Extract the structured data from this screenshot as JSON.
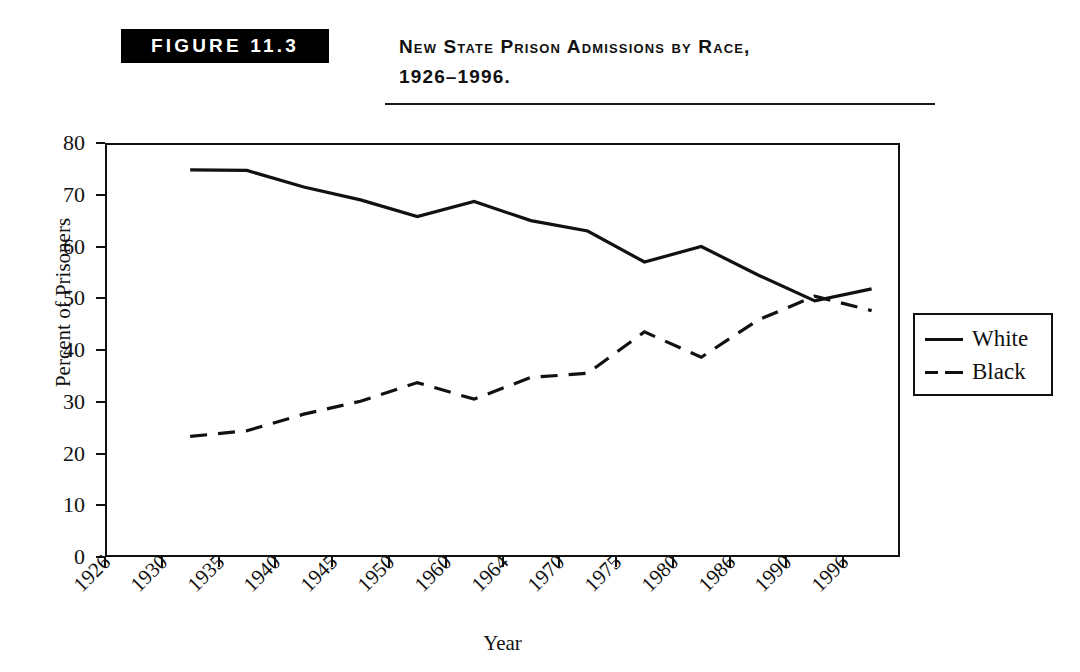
{
  "figure": {
    "badge_label": "FIGURE 11.3",
    "title_line1": "New State Prison Admissions by Race,",
    "title_line2": "1926–1996."
  },
  "legend": {
    "position": "right",
    "entries": [
      {
        "label": "White",
        "style": "solid"
      },
      {
        "label": "Black",
        "style": "dashed"
      }
    ]
  },
  "chart_data": {
    "type": "line",
    "title": "New State Prison Admissions by Race, 1926–1996.",
    "xlabel": "Year",
    "ylabel": "Percent of Prisoners",
    "categories": [
      "1926",
      "1930",
      "1935",
      "1940",
      "1945",
      "1950",
      "1960",
      "1964",
      "1970",
      "1975",
      "1980",
      "1986",
      "1990",
      "1996"
    ],
    "x_tick_labels": [
      "1926",
      "1930",
      "1935",
      "1940",
      "1945",
      "1950",
      "1960",
      "1964",
      "1970",
      "1975",
      "1980",
      "1986",
      "1990",
      "1996"
    ],
    "y_tick_labels": [
      "0",
      "10",
      "20",
      "30",
      "40",
      "50",
      "60",
      "70",
      "80"
    ],
    "y_ticks": [
      0,
      10,
      20,
      30,
      40,
      50,
      60,
      70,
      80
    ],
    "ylim": [
      0,
      80
    ],
    "grid": false,
    "series": [
      {
        "name": "White",
        "style": "solid",
        "color": "#111111",
        "x": [
          "1930",
          "1935",
          "1940",
          "1945",
          "1950",
          "1960",
          "1964",
          "1970",
          "1975",
          "1980",
          "1986",
          "1990",
          "1996"
        ],
        "values": [
          74.8,
          74.7,
          71.5,
          69.0,
          65.8,
          68.7,
          65.0,
          63.0,
          57.0,
          60.0,
          54.5,
          49.5,
          51.8
        ]
      },
      {
        "name": "Black",
        "style": "dashed",
        "color": "#111111",
        "x": [
          "1930",
          "1935",
          "1940",
          "1945",
          "1950",
          "1960",
          "1964",
          "1970",
          "1975",
          "1980",
          "1986",
          "1990",
          "1996"
        ],
        "values": [
          23.3,
          24.4,
          27.6,
          30.1,
          33.7,
          30.5,
          34.7,
          35.5,
          43.5,
          38.6,
          45.8,
          50.4,
          47.6
        ]
      }
    ]
  }
}
